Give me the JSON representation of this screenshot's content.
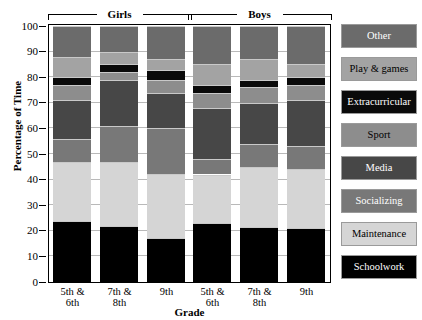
{
  "chart_data": {
    "type": "bar",
    "subtype": "stacked-bar-100",
    "title": "",
    "xlabel": "Grade",
    "ylabel": "Percentage of Time",
    "ylim": [
      0,
      100
    ],
    "yticks": [
      0,
      10,
      20,
      30,
      40,
      50,
      60,
      70,
      80,
      90,
      100
    ],
    "grid": true,
    "legend_position": "right",
    "groups": [
      {
        "label": "Girls",
        "categories": [
          "5th & 6th",
          "7th & 8th",
          "9th"
        ]
      },
      {
        "label": "Boys",
        "categories": [
          "5th & 6th",
          "7th & 8th",
          "9th"
        ]
      }
    ],
    "categories": [
      "5th & 6th",
      "7th & 8th",
      "9th",
      "5th & 6th",
      "7th & 8th",
      "9th"
    ],
    "category_lines": [
      [
        "5th &",
        "6th"
      ],
      [
        "7th &",
        "8th"
      ],
      [
        "9th",
        ""
      ],
      [
        "5th &",
        "6th"
      ],
      [
        "7th &",
        "8th"
      ],
      [
        "9th",
        ""
      ]
    ],
    "series": [
      {
        "name": "Schoolwork",
        "color": "#000000",
        "values": [
          24,
          22,
          17,
          23,
          21.5,
          21
        ]
      },
      {
        "name": "Maintenance",
        "color": "#d5d5d5",
        "values": [
          23,
          25,
          25,
          19,
          23.5,
          23
        ]
      },
      {
        "name": "Socializing",
        "color": "#787878",
        "values": [
          9,
          14,
          18,
          6,
          9,
          9
        ]
      },
      {
        "name": "Media",
        "color": "#474747",
        "values": [
          15,
          18,
          14,
          20,
          16,
          18
        ]
      },
      {
        "name": "Sport",
        "color": "#8d8d8d",
        "values": [
          6,
          3,
          5,
          6,
          6,
          6
        ]
      },
      {
        "name": "Extracurricular",
        "color": "#0a0a0a",
        "values": [
          3,
          3,
          4,
          3,
          3,
          3
        ]
      },
      {
        "name": "Play & games",
        "color": "#a3a3a3",
        "values": [
          8,
          5,
          4,
          8,
          8,
          5
        ]
      },
      {
        "name": "Other",
        "color": "#6b6b6b",
        "values": [
          12,
          10,
          13,
          15,
          13,
          15
        ]
      }
    ]
  },
  "legend": {
    "items": [
      {
        "label": "Other",
        "color": "#6b6b6b"
      },
      {
        "label": "Play & games",
        "color": "#a3a3a3"
      },
      {
        "label": "Extracurricular",
        "color": "#0a0a0a"
      },
      {
        "label": "Sport",
        "color": "#8d8d8d"
      },
      {
        "label": "Media",
        "color": "#474747"
      },
      {
        "label": "Socializing",
        "color": "#787878"
      },
      {
        "label": "Maintenance",
        "color": "#d5d5d5"
      },
      {
        "label": "Schoolwork",
        "color": "#000000"
      }
    ]
  }
}
